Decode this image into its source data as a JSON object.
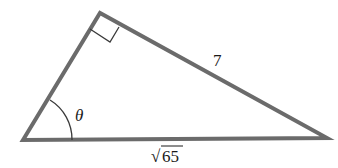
{
  "diagram": {
    "type": "right-triangle",
    "vertices": {
      "left": [
        23,
        140
      ],
      "top": [
        100,
        13
      ],
      "right": [
        327,
        138
      ]
    },
    "right_angle_at": "top",
    "labels": {
      "hypotenuse_side": "7",
      "base": "65",
      "base_prefix": "√",
      "angle": "θ"
    },
    "colors": {
      "stroke": "#6b6b6b",
      "text": "#1a1a1a"
    }
  }
}
